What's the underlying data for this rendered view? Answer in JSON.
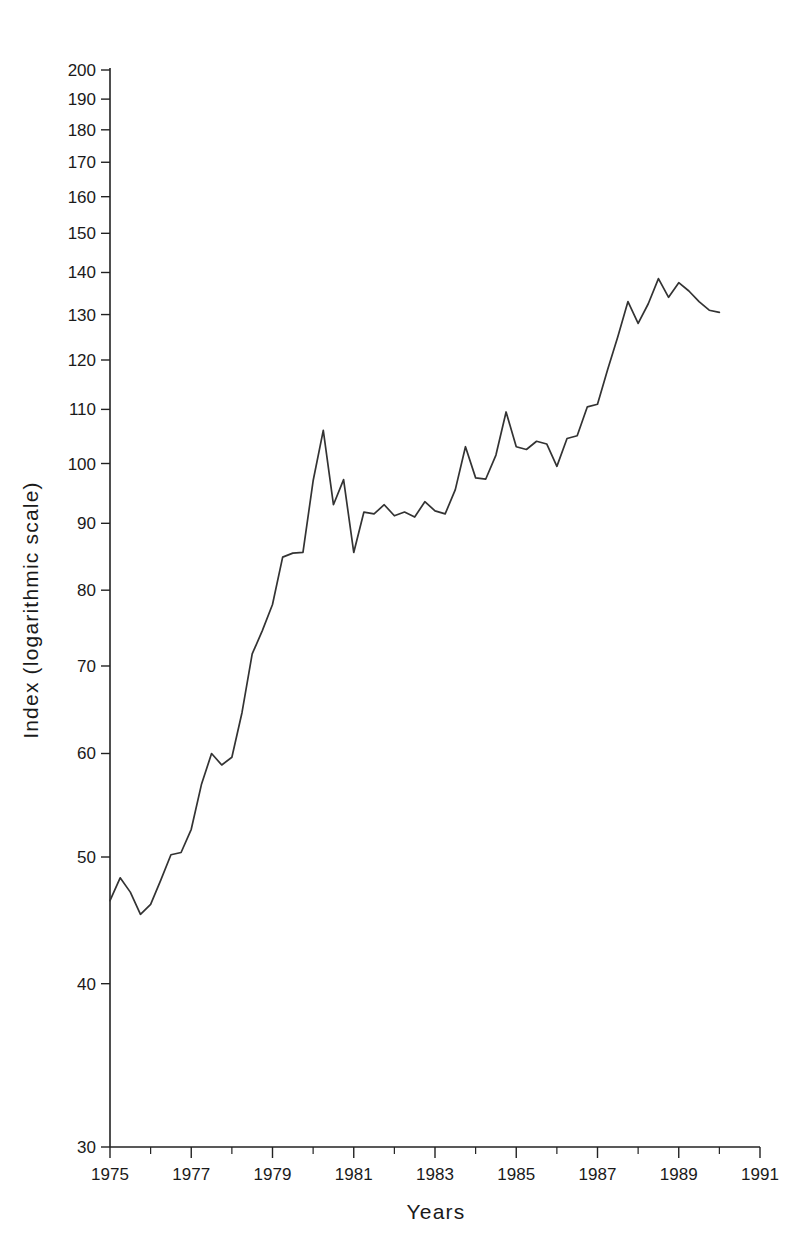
{
  "chart_data": {
    "type": "line",
    "title": "",
    "xlabel": "Years",
    "ylabel": "Index (logarithmic scale)",
    "yscale": "log",
    "ylim": [
      30,
      200
    ],
    "xlim": [
      1975,
      1991
    ],
    "grid": false,
    "legend": null,
    "y_ticks": [
      30,
      40,
      50,
      60,
      70,
      80,
      90,
      100,
      110,
      120,
      130,
      140,
      150,
      160,
      170,
      180,
      190,
      200
    ],
    "y_tick_labels": [
      "30",
      "40",
      "50",
      "60",
      "70",
      "80",
      "90",
      "100",
      "110",
      "120",
      "130",
      "140",
      "150",
      "160",
      "170",
      "180",
      "190",
      "200"
    ],
    "x_ticks": [
      1975,
      1977,
      1979,
      1981,
      1983,
      1985,
      1987,
      1989,
      1991
    ],
    "x_tick_labels": [
      "1975",
      "1977",
      "1979",
      "1981",
      "1983",
      "1985",
      "1987",
      "1989",
      "1991"
    ],
    "x_minor_ticks": [
      1976,
      1978,
      1980,
      1982,
      1984,
      1986,
      1988,
      1990
    ],
    "series": [
      {
        "name": "Index",
        "x": [
          1975.0,
          1975.25,
          1975.5,
          1975.75,
          1976.0,
          1976.25,
          1976.5,
          1976.75,
          1977.0,
          1977.25,
          1977.5,
          1977.75,
          1978.0,
          1978.25,
          1978.5,
          1978.75,
          1979.0,
          1979.25,
          1979.5,
          1979.75,
          1980.0,
          1980.25,
          1980.5,
          1980.75,
          1981.0,
          1981.25,
          1981.5,
          1981.75,
          1982.0,
          1982.25,
          1982.5,
          1982.75,
          1983.0,
          1983.25,
          1983.5,
          1983.75,
          1984.0,
          1984.25,
          1984.5,
          1984.75,
          1985.0,
          1985.25,
          1985.5,
          1985.75,
          1986.0,
          1986.25,
          1986.5,
          1986.75,
          1987.0,
          1987.25,
          1987.5,
          1987.75,
          1988.0,
          1988.25,
          1988.5,
          1988.75,
          1989.0,
          1989.25,
          1989.5,
          1989.75,
          1990.0
        ],
        "values": [
          46.3,
          48.2,
          47.0,
          45.2,
          46.0,
          48.0,
          50.2,
          50.4,
          52.5,
          56.8,
          60.0,
          58.8,
          59.6,
          64.5,
          71.5,
          74.5,
          78.0,
          84.8,
          85.4,
          85.5,
          97.0,
          106.0,
          93.0,
          97.2,
          85.5,
          91.8,
          91.5,
          93.0,
          91.2,
          91.8,
          91.0,
          93.5,
          92.0,
          91.5,
          95.5,
          103.0,
          97.5,
          97.3,
          101.5,
          109.5,
          103.0,
          102.5,
          104.0,
          103.5,
          99.5,
          104.5,
          105.0,
          110.5,
          111.0,
          118.0,
          125.0,
          133.0,
          128.0,
          132.5,
          138.5,
          134.0,
          137.5,
          135.5,
          133.0,
          131.0,
          130.5
        ]
      }
    ]
  },
  "axes": {
    "y_axis_title": "Index (logarithmic scale)",
    "x_axis_title": "Years"
  }
}
